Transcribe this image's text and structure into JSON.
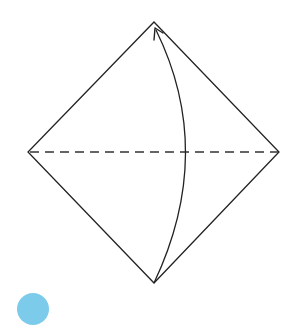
{
  "diagram": {
    "type": "origami-fold-step",
    "shape": {
      "vertices": {
        "top": [
          154,
          22
        ],
        "left": [
          28,
          152
        ],
        "right": [
          279,
          152
        ],
        "bottom": [
          154,
          283
        ]
      },
      "stroke_color": "#222222"
    },
    "fold_line": {
      "style": "dashed",
      "from": [
        30,
        152
      ],
      "to": [
        278,
        152
      ],
      "color": "#333333"
    },
    "arrow": {
      "direction": "bottom-to-top",
      "from": [
        154,
        283
      ],
      "to": [
        155,
        29
      ],
      "curve_bulge_x": 195,
      "color": "#222222"
    },
    "step_badge": {
      "color": "#7ccbeb",
      "label": ""
    }
  }
}
